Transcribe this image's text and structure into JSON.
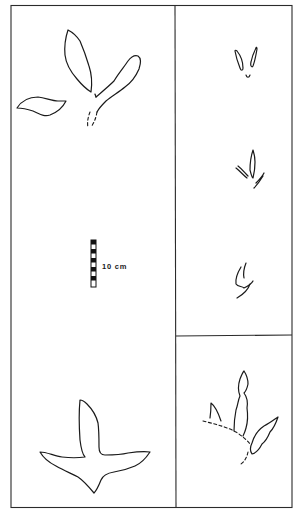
{
  "figure": {
    "panels": [
      {
        "id": "left",
        "content": "large tridactyl footprint outlines (two tracks) with scale bar"
      },
      {
        "id": "right-top",
        "content": "trackway of three small footprints"
      },
      {
        "id": "right-bottom",
        "content": "single footprint with dashed outline"
      }
    ],
    "scale_bar": {
      "label": "10 cm",
      "segments": 7
    },
    "colors": {
      "line": "#1a1a1a",
      "background": "#ffffff"
    }
  }
}
